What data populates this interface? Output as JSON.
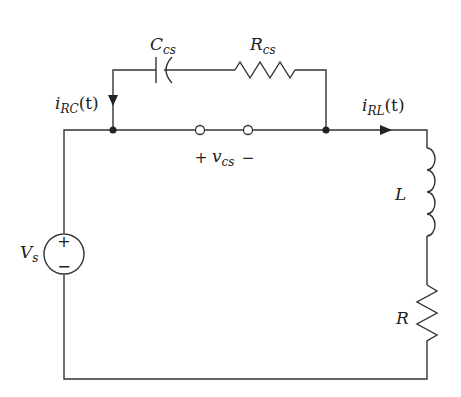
{
  "diagram": {
    "type": "circuit",
    "components": {
      "source": {
        "label": "V",
        "sub": "s",
        "plus": "+",
        "minus": "−"
      },
      "capacitor": {
        "label": "C",
        "sub": "cs"
      },
      "resistor_cs": {
        "label": "R",
        "sub": "cs"
      },
      "inductor": {
        "label": "L"
      },
      "resistor": {
        "label": "R"
      }
    },
    "currents": {
      "i_rc": {
        "label": "i",
        "sub": "RC",
        "suffix": "(t)"
      },
      "i_rl": {
        "label": "i",
        "sub": "RL",
        "suffix": "(t)"
      }
    },
    "voltage": {
      "label": "v",
      "sub": "cs",
      "plus": "+",
      "minus": "−"
    }
  }
}
